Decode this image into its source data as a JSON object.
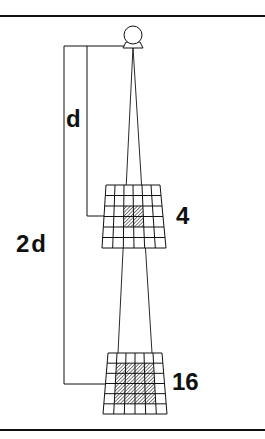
{
  "diagram": {
    "labels": {
      "distance_near": "d",
      "distance_far": "2d",
      "area_near": "4",
      "area_far": "16"
    },
    "source": {
      "icon": "light-source-icon",
      "cx": 133,
      "cy": 35,
      "r": 9
    },
    "grids": [
      {
        "name": "near-grid",
        "rows": 6,
        "cols": 6,
        "top": {
          "y": 185,
          "x1": 106,
          "x2": 160
        },
        "bottom": {
          "y": 248,
          "x1": 102,
          "x2": 166
        },
        "shaded": {
          "row_start": 2,
          "row_end": 4,
          "col_start": 2,
          "col_end": 4
        },
        "shaded_count": 4
      },
      {
        "name": "far-grid",
        "rows": 6,
        "cols": 6,
        "top": {
          "y": 353,
          "x1": 108,
          "x2": 162
        },
        "bottom": {
          "y": 414,
          "x1": 103,
          "x2": 167
        },
        "shaded": {
          "row_start": 1,
          "row_end": 5,
          "col_start": 1,
          "col_end": 5
        },
        "shaded_count": 16
      }
    ],
    "colors": {
      "ink": "#111111",
      "background": "#ffffff"
    }
  }
}
